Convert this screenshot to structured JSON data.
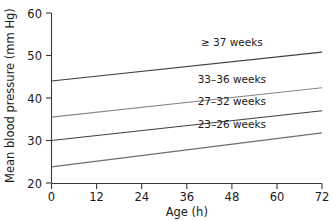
{
  "chart_data": {
    "type": "line",
    "title": "",
    "xlabel": "Age (h)",
    "ylabel": "Mean blood pressure (mm Hg)",
    "xlim": [
      0,
      72
    ],
    "ylim": [
      20,
      60
    ],
    "xticks": [
      0,
      12,
      24,
      36,
      48,
      60,
      72
    ],
    "yticks": [
      20,
      30,
      40,
      50,
      60
    ],
    "xticklabels": [
      "0",
      "12",
      "24",
      "36",
      "48",
      "60",
      "72"
    ],
    "yticklabels": [
      "20",
      "30",
      "40",
      "50",
      "60"
    ],
    "grid": false,
    "legend_position": "inline-right",
    "x": [
      0,
      72
    ],
    "series": [
      {
        "name": "≥ 37 weeks",
        "label": "≥ 37 weeks",
        "values": [
          44.0,
          50.8
        ],
        "color": "#3f3f3f",
        "label_x": 48,
        "label_y": 52.2
      },
      {
        "name": "33–36 weeks",
        "label": "33–36 weeks",
        "values": [
          35.5,
          42.4
        ],
        "color": "#8a8a8a",
        "label_x": 48,
        "label_y": 43.6
      },
      {
        "name": "27–32 weeks",
        "label": "27–32 weeks",
        "values": [
          30.0,
          37.0
        ],
        "color": "#3f3f3f",
        "label_x": 48,
        "label_y": 38.3
      },
      {
        "name": "23–26 weeks",
        "label": "23–26 weeks",
        "values": [
          23.8,
          31.8
        ],
        "color": "#6e6e6e",
        "label_x": 48,
        "label_y": 33.0
      }
    ]
  },
  "axes": {
    "x_title": "Age (h)",
    "y_title": "Mean blood pressure (mm Hg)"
  }
}
